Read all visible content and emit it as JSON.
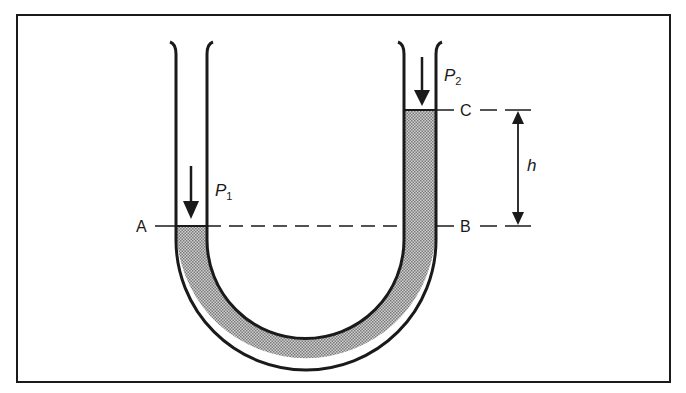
{
  "diagram": {
    "type": "u-tube-manometer",
    "labels": {
      "point_a": "A",
      "point_b": "B",
      "point_c": "C",
      "height": "h",
      "pressure_left": "P",
      "pressure_left_sub": "1",
      "pressure_right": "P",
      "pressure_right_sub": "2"
    },
    "colors": {
      "stroke": "#1a1a1a",
      "fluid": "#b8b8b8",
      "background": "#ffffff"
    }
  }
}
